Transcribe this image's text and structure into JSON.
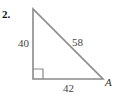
{
  "problem": {
    "number": "2."
  },
  "triangle": {
    "type": "right-triangle",
    "sides": {
      "vertical_leg": "40",
      "hypotenuse": "58",
      "horizontal_leg": "42"
    },
    "vertex_label": "A",
    "right_angle_position": "bottom-left",
    "stroke_color": "#8a8a8a"
  }
}
